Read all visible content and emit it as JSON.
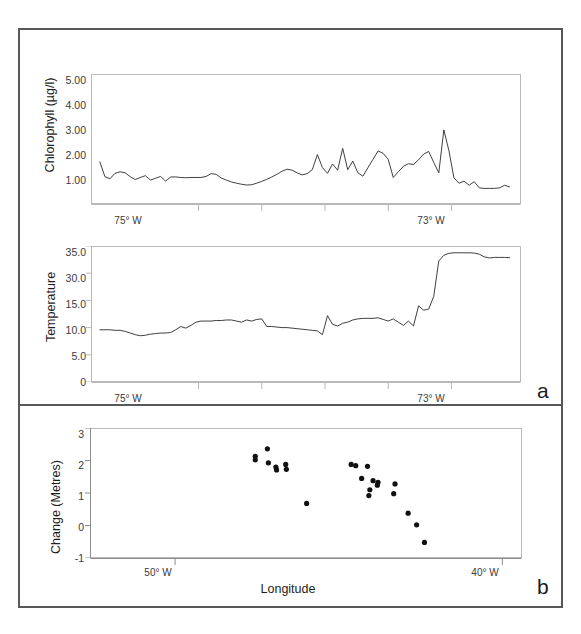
{
  "figure": {
    "panels": [
      {
        "letter": "a",
        "charts": [
          "chlorophyll",
          "temperature"
        ]
      },
      {
        "letter": "b",
        "charts": [
          "change"
        ]
      }
    ]
  },
  "chart_data": [
    {
      "id": "chlorophyll",
      "type": "line",
      "title": "",
      "xlabel": "",
      "ylabel": "Chlorophyll (µg/l)",
      "ylim": [
        0,
        5.0
      ],
      "yticks": [
        1.0,
        2.0,
        3.0,
        4.0,
        5.0
      ],
      "ytick_labels": [
        "1.00",
        "2.00",
        "3.00",
        "4.00",
        "5.00"
      ],
      "xlim": [
        -75.85,
        -72.45
      ],
      "xticks": [
        -75.0,
        -74.5,
        -74.0,
        -73.5,
        -73.0
      ],
      "xtick_labels": [
        "75° W",
        "",
        "",
        "",
        "73° W"
      ],
      "xtick_labeled": [
        -75.0,
        -73.0
      ],
      "grid": false,
      "legend": "none",
      "x": [
        -75.78,
        -75.74,
        -75.7,
        -75.66,
        -75.62,
        -75.58,
        -75.54,
        -75.5,
        -75.46,
        -75.42,
        -75.38,
        -75.34,
        -75.3,
        -75.26,
        -75.22,
        -75.18,
        -75.14,
        -75.1,
        -75.06,
        -75.02,
        -74.98,
        -74.94,
        -74.9,
        -74.86,
        -74.82,
        -74.78,
        -74.74,
        -74.7,
        -74.66,
        -74.62,
        -74.58,
        -74.54,
        -74.5,
        -74.46,
        -74.42,
        -74.38,
        -74.34,
        -74.3,
        -74.26,
        -74.22,
        -74.18,
        -74.14,
        -74.1,
        -74.06,
        -74.02,
        -73.98,
        -73.94,
        -73.9,
        -73.86,
        -73.82,
        -73.78,
        -73.74,
        -73.7,
        -73.66,
        -73.62,
        -73.58,
        -73.54,
        -73.5,
        -73.46,
        -73.42,
        -73.38,
        -73.34,
        -73.3,
        -73.26,
        -73.22,
        -73.18,
        -73.14,
        -73.1,
        -73.06,
        -73.02,
        -72.98,
        -72.94,
        -72.9,
        -72.86,
        -72.82,
        -72.78,
        -72.74,
        -72.7,
        -72.66,
        -72.62,
        -72.58,
        -72.54
      ],
      "values": [
        1.62,
        1.05,
        0.97,
        1.18,
        1.24,
        1.2,
        1.05,
        0.94,
        1.02,
        1.09,
        0.92,
        0.99,
        1.06,
        0.88,
        1.04,
        1.04,
        1.02,
        1.01,
        1.02,
        1.02,
        1.02,
        1.06,
        1.17,
        1.14,
        1.0,
        0.92,
        0.85,
        0.8,
        0.76,
        0.73,
        0.74,
        0.8,
        0.87,
        0.95,
        1.04,
        1.14,
        1.26,
        1.34,
        1.3,
        1.2,
        1.12,
        1.17,
        1.32,
        1.9,
        1.4,
        1.18,
        1.54,
        1.3,
        2.14,
        1.32,
        1.65,
        1.2,
        1.07,
        1.4,
        1.72,
        2.04,
        1.95,
        1.72,
        1.02,
        1.24,
        1.45,
        1.55,
        1.52,
        1.7,
        1.92,
        2.02,
        1.6,
        1.2,
        2.85,
        2.05,
        1.0,
        0.8,
        0.88,
        0.72,
        0.86,
        0.62,
        0.6,
        0.6,
        0.6,
        0.62,
        0.72,
        0.66
      ]
    },
    {
      "id": "temperature",
      "type": "line",
      "title": "",
      "xlabel": "",
      "ylabel": "Temperature",
      "ylim": [
        0,
        35.0
      ],
      "yticks": [
        0,
        5.0,
        10.0,
        15.0,
        30.0,
        35.0
      ],
      "ytick_labels": [
        "0",
        "5.0",
        "10.0",
        "15.0",
        "30.0",
        "35.0"
      ],
      "ytick_positions": [
        0,
        5,
        10,
        15,
        20,
        25
      ],
      "xlim": [
        -75.85,
        -72.45
      ],
      "xticks": [
        -75.0,
        -74.5,
        -74.0,
        -73.5,
        -73.0
      ],
      "xtick_labels": [
        "75° W",
        "",
        "",
        "",
        "73° W"
      ],
      "xtick_labeled": [
        -75.0,
        -73.0
      ],
      "grid": false,
      "legend": "none",
      "x": [
        -75.78,
        -75.74,
        -75.7,
        -75.66,
        -75.62,
        -75.58,
        -75.54,
        -75.5,
        -75.46,
        -75.42,
        -75.38,
        -75.34,
        -75.3,
        -75.26,
        -75.22,
        -75.18,
        -75.14,
        -75.1,
        -75.06,
        -75.02,
        -74.98,
        -74.94,
        -74.9,
        -74.86,
        -74.82,
        -74.78,
        -74.74,
        -74.7,
        -74.66,
        -74.62,
        -74.58,
        -74.54,
        -74.5,
        -74.46,
        -74.42,
        -74.38,
        -74.34,
        -74.3,
        -74.26,
        -74.22,
        -74.18,
        -74.14,
        -74.1,
        -74.06,
        -74.02,
        -73.98,
        -73.94,
        -73.9,
        -73.86,
        -73.82,
        -73.78,
        -73.74,
        -73.7,
        -73.66,
        -73.62,
        -73.58,
        -73.54,
        -73.5,
        -73.46,
        -73.42,
        -73.38,
        -73.34,
        -73.3,
        -73.26,
        -73.22,
        -73.18,
        -73.14,
        -73.1,
        -73.06,
        -73.02,
        -72.98,
        -72.94,
        -72.9,
        -72.86,
        -72.82,
        -72.78,
        -72.74,
        -72.7,
        -72.66,
        -72.62,
        -72.58,
        -72.54
      ],
      "values": [
        9.6,
        9.6,
        9.6,
        9.5,
        9.5,
        9.3,
        9.0,
        8.7,
        8.5,
        8.6,
        8.8,
        8.9,
        9.0,
        9.0,
        9.1,
        9.6,
        10.2,
        9.9,
        10.4,
        11.0,
        11.2,
        11.2,
        11.2,
        11.3,
        11.3,
        11.4,
        11.4,
        11.2,
        11.0,
        11.4,
        11.2,
        11.5,
        11.6,
        10.2,
        10.2,
        10.1,
        10.0,
        10.0,
        9.9,
        9.8,
        9.7,
        9.6,
        9.5,
        9.4,
        8.7,
        12.2,
        10.6,
        10.3,
        10.8,
        11.0,
        11.4,
        11.6,
        11.7,
        11.7,
        11.7,
        11.8,
        11.5,
        11.2,
        11.6,
        11.0,
        10.4,
        11.2,
        10.3,
        14.0,
        13.2,
        13.4,
        16.5,
        29.5,
        31.6,
        32.3,
        32.5,
        32.5,
        32.5,
        32.5,
        32.4,
        32.0,
        31.0,
        30.6,
        30.8,
        30.8,
        30.8,
        30.7
      ]
    },
    {
      "id": "change",
      "type": "scatter",
      "title": "",
      "xlabel": "Longitude",
      "ylabel": "Change (Metres)",
      "ylim": [
        -1,
        3
      ],
      "yticks": [
        -1,
        0,
        1,
        2,
        3
      ],
      "ytick_labels": [
        "-1",
        "0",
        "1",
        "2",
        "3"
      ],
      "xlim": [
        -52.6,
        -39.4
      ],
      "xticks": [
        -50.0,
        -40.0
      ],
      "xtick_labels": [
        "50° W",
        "40° W"
      ],
      "grid": false,
      "legend": "none",
      "points": [
        {
          "x": -47.55,
          "y": 2.13
        },
        {
          "x": -47.55,
          "y": 2.02
        },
        {
          "x": -47.18,
          "y": 2.36
        },
        {
          "x": -47.15,
          "y": 1.93
        },
        {
          "x": -46.92,
          "y": 1.8
        },
        {
          "x": -46.9,
          "y": 1.71
        },
        {
          "x": -46.62,
          "y": 1.88
        },
        {
          "x": -46.6,
          "y": 1.73
        },
        {
          "x": -45.98,
          "y": 0.68
        },
        {
          "x": -44.62,
          "y": 1.88
        },
        {
          "x": -44.48,
          "y": 1.84
        },
        {
          "x": -44.12,
          "y": 1.82
        },
        {
          "x": -44.3,
          "y": 1.45
        },
        {
          "x": -43.95,
          "y": 1.38
        },
        {
          "x": -43.8,
          "y": 1.33
        },
        {
          "x": -43.82,
          "y": 1.24
        },
        {
          "x": -44.05,
          "y": 1.1
        },
        {
          "x": -44.08,
          "y": 0.92
        },
        {
          "x": -43.28,
          "y": 1.28
        },
        {
          "x": -43.32,
          "y": 0.98
        },
        {
          "x": -42.88,
          "y": 0.38
        },
        {
          "x": -42.62,
          "y": 0.02
        },
        {
          "x": -42.38,
          "y": -0.52
        }
      ]
    }
  ]
}
